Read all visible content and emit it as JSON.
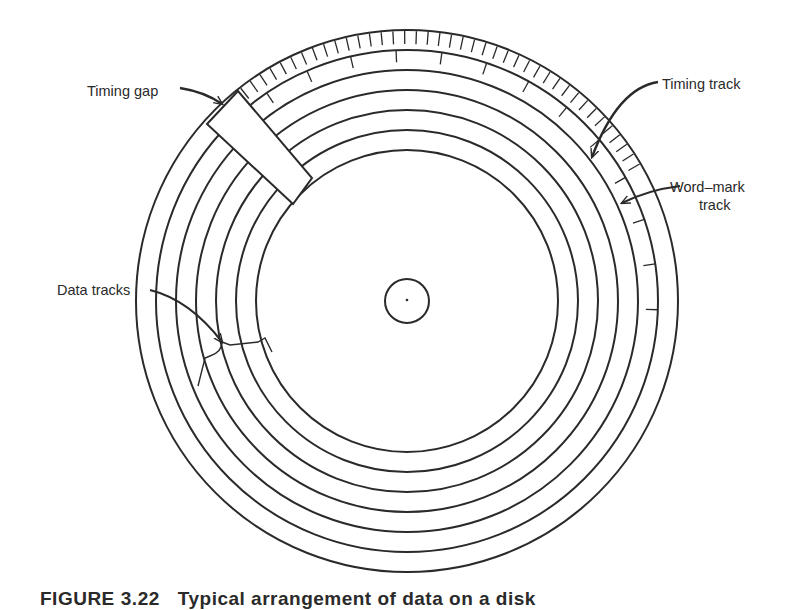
{
  "figure": {
    "caption_prefix": "FIGURE",
    "caption_number": "3.22",
    "caption_text": "Typical arrangement of data on a disk"
  },
  "labels": {
    "timing_gap": "Timing gap",
    "timing_track": "Timing track",
    "word_mark_line1": "Word–mark",
    "word_mark_line2": "track",
    "data_tracks": "Data tracks"
  },
  "disk": {
    "center": [
      407,
      301
    ],
    "outer_radius": 271,
    "timing_track_inner_radius": 251,
    "word_mark_track_inner_radius": 231,
    "data_track_radii": [
      211,
      191,
      171,
      151
    ],
    "hub_radius": 22,
    "timing_ticks_deg_range": [
      30,
      128
    ],
    "timing_tick_step_deg": 2.5,
    "word_mark_ticks_deg_range": [
      -7,
      124
    ],
    "word_mark_tick_step_deg": 10.5,
    "stroke_color": "#2a2a2a"
  }
}
